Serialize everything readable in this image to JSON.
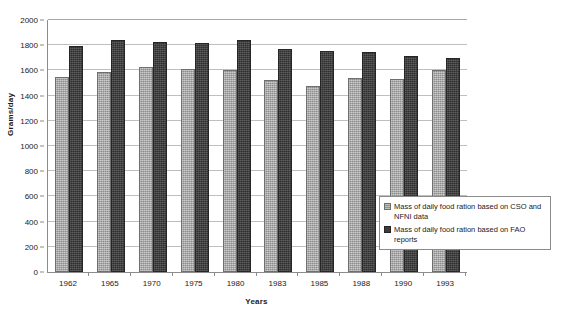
{
  "chart_data": {
    "type": "bar",
    "title": "",
    "xlabel": "Years",
    "ylabel": "Grams/day",
    "categories": [
      "1962",
      "1965",
      "1970",
      "1975",
      "1980",
      "1983",
      "1985",
      "1988",
      "1990",
      "1993"
    ],
    "ylim": [
      0,
      2000
    ],
    "yticks": [
      0,
      200,
      400,
      600,
      800,
      1000,
      1200,
      1400,
      1600,
      1800,
      2000
    ],
    "grid": true,
    "legend_position": "inside-bottom-right",
    "series": [
      {
        "name": "Mass of daily food ration based on CSO and NFNI data",
        "color": "#9c9c9c",
        "values": [
          1545,
          1590,
          1625,
          1615,
          1605,
          1525,
          1480,
          1540,
          1530,
          1600
        ]
      },
      {
        "name": "Mass of daily food ration based on FAO reports",
        "color": "#3c3c3c",
        "values": [
          1790,
          1845,
          1825,
          1820,
          1840,
          1770,
          1755,
          1750,
          1715,
          1700
        ]
      }
    ]
  },
  "legend": {
    "items": [
      {
        "label": "Mass of daily food ration based on CSO and NFNI data"
      },
      {
        "label": "Mass of daily food ration based on FAO reports"
      }
    ]
  }
}
